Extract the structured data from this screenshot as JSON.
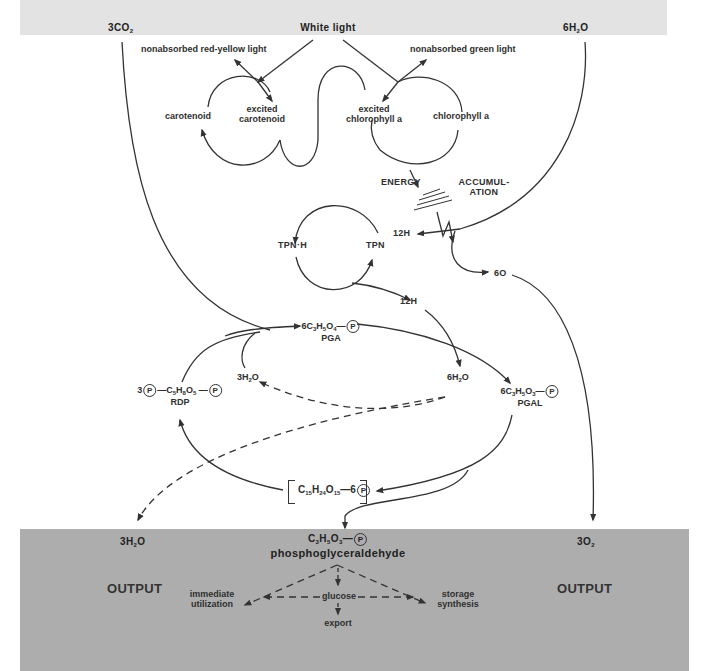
{
  "diagram": {
    "colors": {
      "top_band": "#e3e3e3",
      "bottom_band": "#adadad",
      "line": "#333333",
      "text": "#2f2f2f"
    },
    "inputs": {
      "co2": "3CO",
      "co2_sub": "2",
      "light": "White light",
      "water": "6H",
      "water_sub": "2",
      "water_tail": "O"
    },
    "light_reactions": {
      "nonabsorbed_red_yellow": "nonabsorbed red-yellow light",
      "nonabsorbed_green": "nonabsorbed green light",
      "carotenoid": "carotenoid",
      "excited_carotenoid_line1": "excited",
      "excited_carotenoid_line2": "carotenoid",
      "excited_chlorophyll_line1": "excited",
      "excited_chlorophyll_line2": "chlorophyll a",
      "chlorophyll": "chlorophyll a",
      "energy": "ENERGY",
      "accumulation_line1": "ACCUMUL-",
      "accumulation_line2": "ATION"
    },
    "tpn_cycle": {
      "tpn_h": "TPN·H",
      "tpn": "TPN",
      "h_in": "12H",
      "h_out": "12H",
      "oxygen": "6O"
    },
    "calvin_cycle": {
      "pga_formula": "6C",
      "pga_parts": [
        "6C",
        "3",
        "H",
        "5",
        "O",
        "4"
      ],
      "pga_name": "PGA",
      "rdp_prefix": "3",
      "rdp_parts": [
        "C",
        "5",
        "H",
        "8",
        "O",
        "5"
      ],
      "rdp_name": "RDP",
      "water_out_left": "3H",
      "water_out_left_sub": "2",
      "water_out_left_tail": "O",
      "water_out_right": "6H",
      "water_out_right_sub": "2",
      "water_out_right_tail": "O",
      "pgal_parts": [
        "6C",
        "3",
        "H",
        "5",
        "O",
        "3"
      ],
      "pgal_name": "PGAL",
      "hexose_parts": [
        "C",
        "15",
        "H",
        "24",
        "O",
        "15",
        "—6"
      ],
      "phosphate_symbol": "P"
    },
    "outputs": {
      "left_label": "OUTPUT",
      "right_label": "OUTPUT",
      "water": "3H",
      "water_sub": "2",
      "water_tail": "O",
      "oxygen": "3O",
      "oxygen_sub": "2",
      "product_parts": [
        "C",
        "3",
        "H",
        "5",
        "O",
        "3"
      ],
      "product_name": "phosphoglyceraldehyde",
      "immediate_line1": "immediate",
      "immediate_line2": "utilization",
      "glucose": "glucose",
      "export": "export",
      "storage_line1": "storage",
      "storage_line2": "synthesis"
    }
  }
}
